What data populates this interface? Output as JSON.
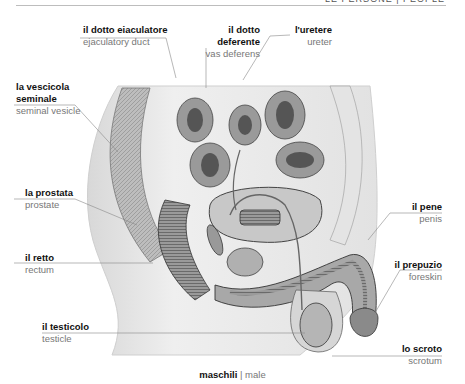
{
  "header": {
    "text": "LE PERSONE | PEOPLE"
  },
  "labels": {
    "ejaculatory_duct": {
      "it": "il dotto eiaculatore",
      "en": "ejaculatory duct"
    },
    "vas_deferens": {
      "it_line1": "il dotto",
      "it_line2": "deferente",
      "en": "vas deferens"
    },
    "ureter": {
      "it": "l'uretere",
      "en": "ureter"
    },
    "seminal_vesicle": {
      "it_line1": "la vescicola",
      "it_line2": "seminale",
      "en": "seminal vesicle"
    },
    "prostate": {
      "it": "la prostata",
      "en": "prostate"
    },
    "rectum": {
      "it": "il retto",
      "en": "rectum"
    },
    "testicle": {
      "it": "il testicolo",
      "en": "testicle"
    },
    "penis": {
      "it": "il pene",
      "en": "penis"
    },
    "foreskin": {
      "it": "il prepuzio",
      "en": "foreskin"
    },
    "scrotum": {
      "it": "lo scroto",
      "en": "scrotum"
    }
  },
  "caption": {
    "it": "maschili",
    "separator": " | ",
    "en": "male"
  },
  "colors": {
    "label_line": "#888888",
    "tissue_light": "#ececec",
    "tissue_mid": "#b8b8b8",
    "tissue_dark": "#5a5a5a"
  }
}
